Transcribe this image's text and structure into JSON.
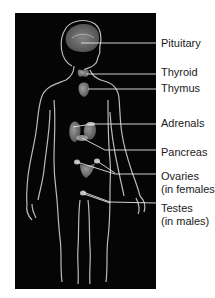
{
  "diagram": {
    "colors": {
      "background": "#ffffff",
      "panel": "#050505",
      "outline": "#d8d8d8",
      "organ": "#8a8a8a",
      "leader": "#e6e6e6",
      "text": "#1a1a1a"
    },
    "labels": [
      {
        "id": "pituitary",
        "text": "Pituitary",
        "sub": null
      },
      {
        "id": "thyroid",
        "text": "Thyroid",
        "sub": null
      },
      {
        "id": "thymus",
        "text": "Thymus",
        "sub": null
      },
      {
        "id": "adrenals",
        "text": "Adrenals",
        "sub": null
      },
      {
        "id": "pancreas",
        "text": "Pancreas",
        "sub": null
      },
      {
        "id": "ovaries",
        "text": "Ovaries",
        "sub": "(in females)"
      },
      {
        "id": "testes",
        "text": "Testes",
        "sub": "(in males)"
      }
    ]
  }
}
